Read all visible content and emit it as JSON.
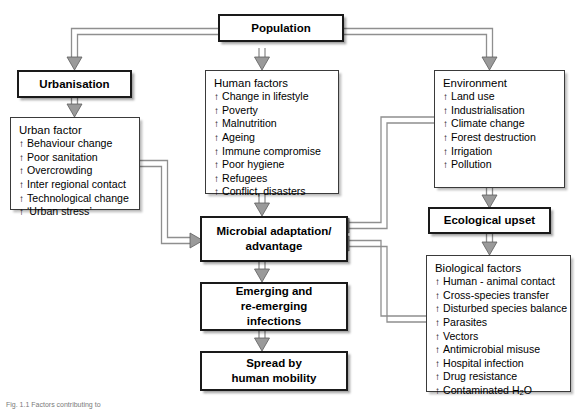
{
  "diagram": {
    "caption": "Fig. 1.1 Factors contributing to",
    "arrow_glyph": "↑",
    "colors": {
      "node_border": "#1a1a1a",
      "list_border": "#3a3a3a",
      "connector": "#8c8c8c",
      "connector_dark": "#6e6e6e",
      "background": "#ffffff",
      "text": "#000000"
    }
  },
  "nodes": {
    "population": {
      "label": "Population"
    },
    "urbanisation": {
      "label": "Urbanisation"
    },
    "ecological_upset": {
      "label": "Ecological upset"
    },
    "microbial": {
      "line1": "Microbial adaptation/",
      "line2": "advantage"
    },
    "emerging": {
      "line1": "Emerging and",
      "line2": "re-emerging",
      "line3": "infections"
    },
    "spread": {
      "line1": "Spread by",
      "line2": "human mobility"
    }
  },
  "panels": {
    "urban_factor": {
      "title": "Urban factor",
      "items": [
        "Behaviour change",
        "Poor sanitation",
        "Overcrowding",
        "Inter regional contact",
        "Technological change",
        "‘Urban stress’"
      ]
    },
    "human_factors": {
      "title": "Human factors",
      "items": [
        "Change in lifestyle",
        "Poverty",
        "Malnutrition",
        "Ageing",
        "Immune compromise",
        "Poor hygiene",
        "Refugees",
        "Conflict, disasters"
      ]
    },
    "environment": {
      "title": "Environment",
      "items": [
        "Land use",
        "Industrialisation",
        "Climate change",
        "Forest destruction",
        "Irrigation",
        "Pollution"
      ]
    },
    "biological_factors": {
      "title": "Biological factors",
      "items": [
        "Human - animal contact",
        "Cross-species transfer",
        "Disturbed species balance",
        "Parasites",
        "Vectors",
        "Antimicrobial misuse",
        "Hospital infection",
        "Drug resistance",
        "Contaminated H₂O"
      ]
    }
  }
}
